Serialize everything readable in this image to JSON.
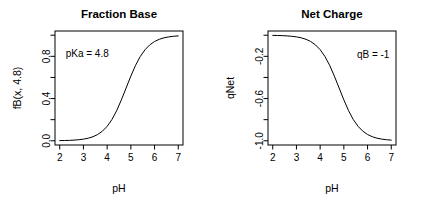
{
  "figure": {
    "background": "#ffffff",
    "foreground": "#000000",
    "panel_count": 2
  },
  "chart_data": [
    {
      "type": "line",
      "panel": "left",
      "title": "Fraction Base",
      "xlabel": "pH",
      "ylabel": "fB(x, 4.8)",
      "xlim": [
        1.8,
        7.2
      ],
      "ylim": [
        -0.04,
        1.04
      ],
      "xticks": [
        2,
        3,
        4,
        5,
        6,
        7
      ],
      "xticklabels": [
        "2",
        "3",
        "4",
        "5",
        "6",
        "7"
      ],
      "yticks": [
        0.0,
        0.2,
        0.4,
        0.6,
        0.8,
        1.0
      ],
      "yticklabels": [
        "0.0",
        "",
        "0.4",
        "",
        "0.8",
        ""
      ],
      "grid": false,
      "legend": false,
      "line_color": "#000000",
      "line_width": 1,
      "annotations": [
        {
          "text": "pKa = 4.8",
          "x": 2.25,
          "y": 0.83
        }
      ],
      "equation": "fB = 1 / (1 + 10^(pKa - pH))",
      "pKa": 4.8,
      "x": [
        2.0,
        2.2,
        2.4,
        2.6,
        2.8,
        3.0,
        3.2,
        3.4,
        3.6,
        3.8,
        4.0,
        4.2,
        4.4,
        4.6,
        4.8,
        5.0,
        5.2,
        5.4,
        5.6,
        5.8,
        6.0,
        6.2,
        6.4,
        6.6,
        6.8,
        7.0
      ],
      "y": [
        0.0016,
        0.0025,
        0.004,
        0.0063,
        0.0099,
        0.0156,
        0.0245,
        0.0383,
        0.0594,
        0.0911,
        0.1368,
        0.2005,
        0.2846,
        0.3874,
        0.5,
        0.6126,
        0.7154,
        0.7995,
        0.8632,
        0.9089,
        0.9406,
        0.9617,
        0.9755,
        0.9842,
        0.99,
        0.9937
      ]
    },
    {
      "type": "line",
      "panel": "right",
      "title": "Net Charge",
      "xlabel": "pH",
      "ylabel": "qNet",
      "xlim": [
        1.8,
        7.2
      ],
      "ylim": [
        -1.04,
        0.04
      ],
      "xticks": [
        2,
        3,
        4,
        5,
        6,
        7
      ],
      "xticklabels": [
        "2",
        "3",
        "4",
        "5",
        "6",
        "7"
      ],
      "yticks": [
        -1.0,
        -0.8,
        -0.6,
        -0.4,
        -0.2,
        0.0
      ],
      "yticklabels": [
        "-1.0",
        "",
        "-0.6",
        "",
        "-0.2",
        ""
      ],
      "grid": false,
      "legend": false,
      "line_color": "#000000",
      "line_width": 1,
      "annotations": [
        {
          "text": "qB = -1",
          "x": 5.55,
          "y": -0.18
        }
      ],
      "equation": "qNet = qB / (1 + 10^(pKa - pH))",
      "pKa": 4.8,
      "qB": -1,
      "x": [
        2.0,
        2.2,
        2.4,
        2.6,
        2.8,
        3.0,
        3.2,
        3.4,
        3.6,
        3.8,
        4.0,
        4.2,
        4.4,
        4.6,
        4.8,
        5.0,
        5.2,
        5.4,
        5.6,
        5.8,
        6.0,
        6.2,
        6.4,
        6.6,
        6.8,
        7.0
      ],
      "y": [
        -0.0016,
        -0.0025,
        -0.004,
        -0.0063,
        -0.0099,
        -0.0156,
        -0.0245,
        -0.0383,
        -0.0594,
        -0.0911,
        -0.1368,
        -0.2005,
        -0.2846,
        -0.3874,
        -0.5,
        -0.6126,
        -0.7154,
        -0.7995,
        -0.8632,
        -0.9089,
        -0.9406,
        -0.9617,
        -0.9755,
        -0.9842,
        -0.99,
        -0.9937
      ]
    }
  ]
}
